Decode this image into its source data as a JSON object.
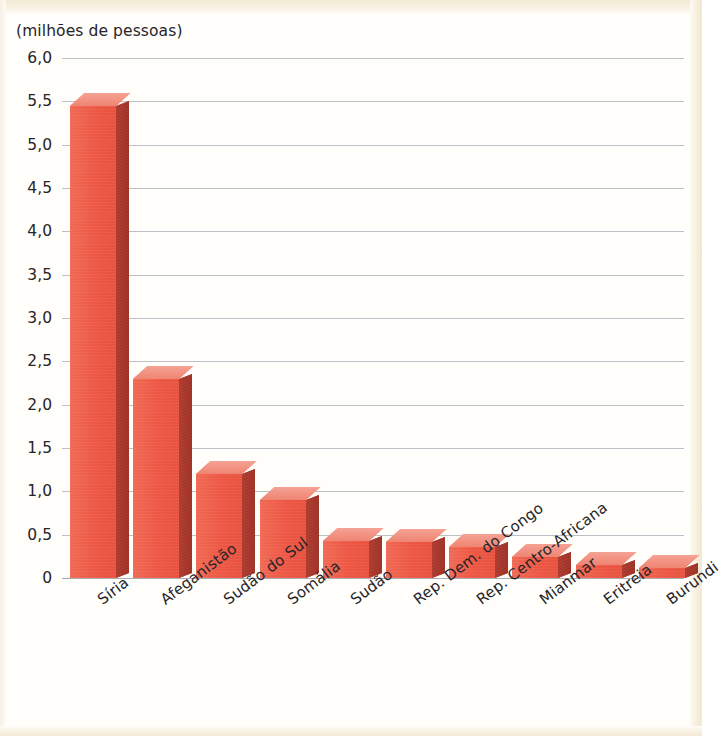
{
  "chart_data": {
    "type": "bar",
    "title": "",
    "axis_caption": "(milhões de pessoas)",
    "xlabel": "",
    "ylabel": "(milhões de pessoas)",
    "ylim": [
      0,
      6.0
    ],
    "grid": true,
    "legend": "none",
    "ytick_labels": [
      "6,0",
      "5,5",
      "5,0",
      "4,5",
      "4,0",
      "3,5",
      "3,0",
      "2,5",
      "2,0",
      "1,5",
      "1,0",
      "0,5",
      "0"
    ],
    "ytick_values": [
      6.0,
      5.5,
      5.0,
      4.5,
      4.0,
      3.5,
      3.0,
      2.5,
      2.0,
      1.5,
      1.0,
      0.5,
      0
    ],
    "categories": [
      "Síria",
      "Afeganistão",
      "Sudão do Sul",
      "Somália",
      "Sudão",
      "Rep. Dem. do Congo",
      "Rep. Centro-Africana",
      "Mianmar",
      "Eritreia",
      "Burundi"
    ],
    "values": [
      5.45,
      2.3,
      1.2,
      0.9,
      0.43,
      0.41,
      0.36,
      0.24,
      0.15,
      0.12
    ],
    "series": [
      {
        "name": "Pessoas refugiadas",
        "values": [
          5.45,
          2.3,
          1.2,
          0.9,
          0.43,
          0.41,
          0.36,
          0.24,
          0.15,
          0.12
        ]
      }
    ],
    "colors": {
      "bar_front": "#ee5a47",
      "bar_side": "#a5362b",
      "bar_top": "#f2907f",
      "gridline": "#b9bcc4",
      "text": "#26252a",
      "background": "#fffefb",
      "scan_band": "#f3ead6"
    }
  }
}
